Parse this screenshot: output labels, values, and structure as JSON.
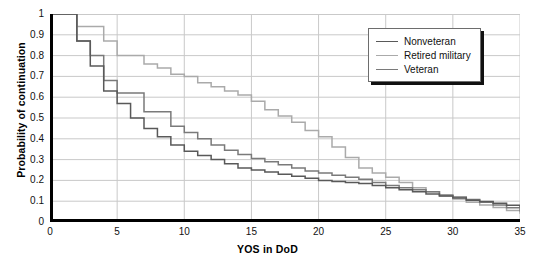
{
  "chart_data": {
    "type": "line",
    "title": "",
    "xlabel": "YOS in DoD",
    "ylabel": "Probability of continuation",
    "xlim": [
      0,
      35
    ],
    "ylim": [
      0,
      1
    ],
    "xticks": [
      0,
      5,
      10,
      15,
      20,
      25,
      30,
      35
    ],
    "yticks": [
      "0",
      "0.1",
      "0.2",
      "0.3",
      "0.4",
      "0.5",
      "0.6",
      "0.7",
      "0.8",
      "0.9",
      "1"
    ],
    "grid": true,
    "legend_position": "top-right",
    "step_style": "post",
    "x": [
      0,
      1,
      2,
      3,
      4,
      5,
      6,
      7,
      8,
      9,
      10,
      11,
      12,
      13,
      14,
      15,
      16,
      17,
      18,
      19,
      20,
      21,
      22,
      23,
      24,
      25,
      26,
      27,
      28,
      29,
      30,
      31,
      32,
      33,
      34,
      35
    ],
    "series": [
      {
        "name": "Nonveteran",
        "color": "#595959",
        "values": [
          1.0,
          1.0,
          0.87,
          0.75,
          0.63,
          0.57,
          0.5,
          0.45,
          0.41,
          0.37,
          0.34,
          0.32,
          0.3,
          0.28,
          0.26,
          0.25,
          0.24,
          0.23,
          0.22,
          0.21,
          0.2,
          0.195,
          0.19,
          0.185,
          0.175,
          0.165,
          0.155,
          0.145,
          0.135,
          0.125,
          0.115,
          0.105,
          0.098,
          0.09,
          0.08,
          0.07
        ]
      },
      {
        "name": "Retired military",
        "color": "#aaaaaa",
        "values": [
          1.0,
          1.0,
          0.94,
          0.94,
          0.87,
          0.8,
          0.8,
          0.76,
          0.74,
          0.71,
          0.7,
          0.67,
          0.65,
          0.63,
          0.61,
          0.58,
          0.54,
          0.51,
          0.48,
          0.44,
          0.41,
          0.36,
          0.31,
          0.26,
          0.235,
          0.215,
          0.19,
          0.165,
          0.145,
          0.125,
          0.11,
          0.095,
          0.082,
          0.07,
          0.055,
          0.04
        ]
      },
      {
        "name": "Veteran",
        "color": "#7a7a7a",
        "values": [
          1.0,
          1.0,
          0.87,
          0.8,
          0.68,
          0.62,
          0.62,
          0.53,
          0.53,
          0.46,
          0.43,
          0.4,
          0.37,
          0.345,
          0.325,
          0.305,
          0.29,
          0.275,
          0.26,
          0.245,
          0.235,
          0.225,
          0.215,
          0.205,
          0.19,
          0.175,
          0.165,
          0.155,
          0.145,
          0.13,
          0.12,
          0.108,
          0.095,
          0.082,
          0.068,
          0.05
        ]
      }
    ]
  },
  "legend": {
    "items": [
      {
        "label": "Nonveteran"
      },
      {
        "label": "Retired military"
      },
      {
        "label": "Veteran"
      }
    ]
  },
  "axes": {
    "y_title": "Probability of continuation",
    "x_title": "YOS in DoD"
  },
  "colors": {
    "axis": "#000000",
    "grid": "#c9c9c9",
    "background": "#ffffff",
    "legend_border": "#6d6d6d",
    "legend_shadow": "#111111"
  }
}
